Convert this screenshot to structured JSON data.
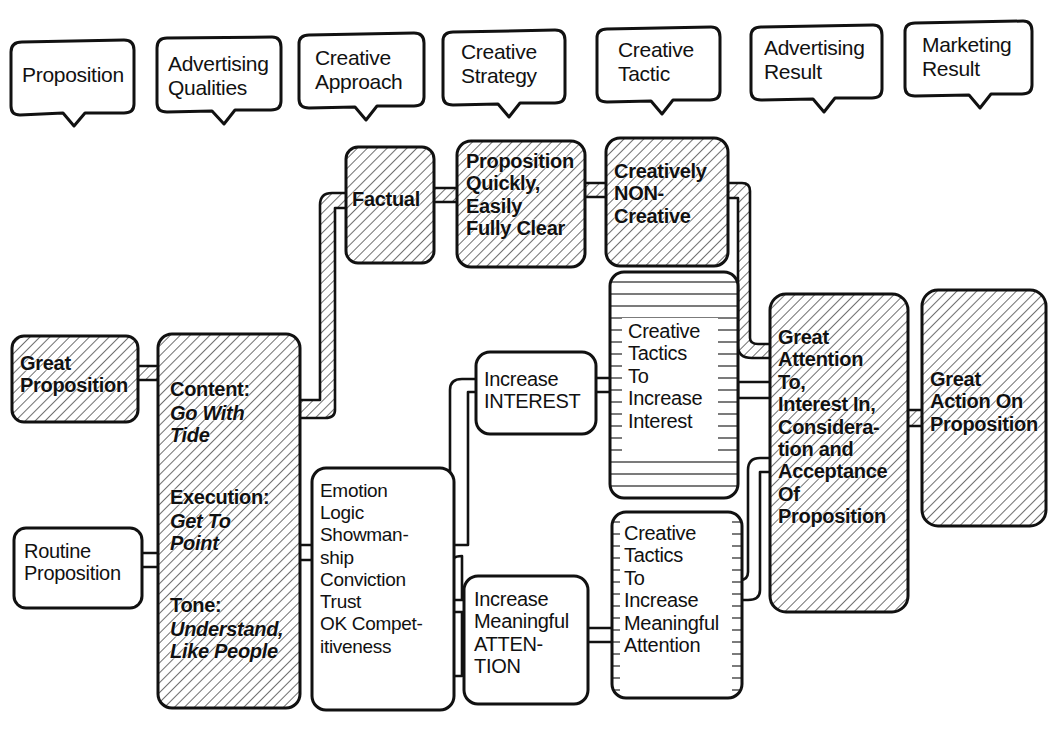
{
  "headers": [
    {
      "label": "Proposition"
    },
    {
      "label": "Advertising\nQualities"
    },
    {
      "label": "Creative\nApproach"
    },
    {
      "label": "Creative\nStrategy"
    },
    {
      "label": "Creative\nTactic"
    },
    {
      "label": "Advertising\nResult"
    },
    {
      "label": "Marketing\nResult"
    }
  ],
  "nodes": {
    "great_proposition": {
      "label": "Great\nProposition",
      "style": "hatched"
    },
    "routine_proposition": {
      "label": "Routine\nProposition",
      "style": "plain"
    },
    "qualities": {
      "style": "hatched",
      "items": [
        {
          "title": "Content:",
          "value": "Go With\nTide"
        },
        {
          "title": "Execution:",
          "value": "Get To\nPoint"
        },
        {
          "title": "Tone:",
          "value": "Understand,\nLike People"
        }
      ]
    },
    "factual": {
      "label": "Factual",
      "style": "hatched"
    },
    "emotion_list": {
      "label": "Emotion\nLogic\nShowman-\nship\nConviction\nTrust\nOK Compet-\nitiveness",
      "style": "plain"
    },
    "strategy_clear": {
      "label": "Proposition\nQuickly,\nEasily\nFully Clear",
      "style": "hatched"
    },
    "increase_interest": {
      "label": "Increase\nINTEREST",
      "style": "plain"
    },
    "increase_attention": {
      "label": "Increase\nMeaningful\nATTEN-\nTION",
      "style": "plain"
    },
    "creatively_non_creative": {
      "label": "Creatively\nNON-\nCreative",
      "style": "hatched"
    },
    "tactics_interest": {
      "label": "Creative\nTactics\nTo\nIncrease\nInterest",
      "style": "lined"
    },
    "tactics_attention": {
      "label": "Creative\nTactics\nTo\nIncrease\nMeaningful\nAttention",
      "style": "lined"
    },
    "advertising_result": {
      "label": "Great\nAttention\nTo,\nInterest In,\nConsidera-\ntion and\nAcceptance\nOf\nProposition",
      "style": "hatched"
    },
    "marketing_result": {
      "label": "Great\nAction On\nProposition",
      "style": "hatched"
    }
  },
  "colors": {
    "ink": "#111111",
    "paper": "#ffffff"
  }
}
